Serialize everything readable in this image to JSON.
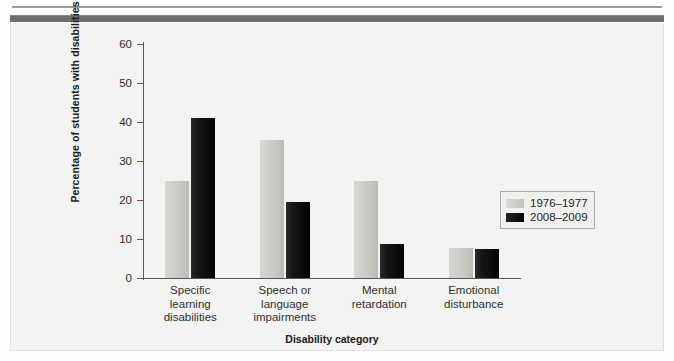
{
  "figure": {
    "background_color": "#f3f3f1",
    "rule_color": "#6e6e6e"
  },
  "legend": {
    "position": "right-middle",
    "entries": [
      {
        "label": "1976–1977",
        "color": "#cccac6",
        "swatch": "light-gray-swatch"
      },
      {
        "label": "2008–2009",
        "color": "#0d0d0d",
        "swatch": "black-swatch"
      }
    ]
  },
  "chart_data": {
    "type": "bar",
    "title": "",
    "xlabel": "Disability category",
    "ylabel": "Percentage of students with disabilities",
    "ylim": [
      0,
      60
    ],
    "yticks": [
      0,
      10,
      20,
      30,
      40,
      50,
      60
    ],
    "ytick_labels": [
      "0",
      "10",
      "20",
      "30",
      "40",
      "50",
      "60"
    ],
    "grid": false,
    "legend_position": "right",
    "categories": [
      "Specific\nlearning\ndisabilities",
      "Speech or\nlanguage\nimpairments",
      "Mental\nretardation",
      "Emotional\ndisturbance"
    ],
    "series": [
      {
        "name": "1976–1977",
        "color": "#cccac6",
        "values": [
          24.9,
          35.5,
          24.9,
          7.6
        ]
      },
      {
        "name": "2008–2009",
        "color": "#0d0d0d",
        "values": [
          41.0,
          19.5,
          8.6,
          7.5
        ]
      }
    ]
  }
}
